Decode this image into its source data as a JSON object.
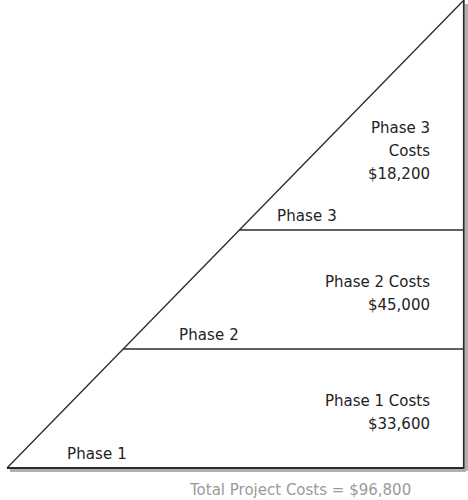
{
  "diagram": {
    "type": "cost-triangle",
    "colors": {
      "background": "#ffffff",
      "line": "#2a2a2a",
      "shadow": "#9a9a9a",
      "text": "#232323"
    },
    "phases": [
      {
        "label": "Phase 1",
        "cost_title": "Phase 1 Costs",
        "cost_value": "$33,600"
      },
      {
        "label": "Phase 2",
        "cost_title": "Phase 2 Costs",
        "cost_value": "$45,000"
      },
      {
        "label": "Phase 3",
        "cost_title_line1": "Phase 3",
        "cost_title_line2": "Costs",
        "cost_value": "$18,200"
      }
    ],
    "footer": "Total Project Costs = $96,800"
  }
}
